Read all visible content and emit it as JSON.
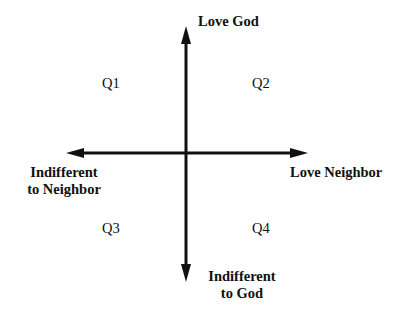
{
  "diagram": {
    "type": "quadrant",
    "axes": {
      "vertical": {
        "top_label": "Love God",
        "bottom_label_line1": "Indifferent",
        "bottom_label_line2": "to God"
      },
      "horizontal": {
        "left_label_line1": "Indifferent",
        "left_label_line2": "to Neighbor",
        "right_label": "Love Neighbor"
      }
    },
    "quadrants": [
      {
        "id": "Q1",
        "label": "Q1"
      },
      {
        "id": "Q2",
        "label": "Q2"
      },
      {
        "id": "Q3",
        "label": "Q3"
      },
      {
        "id": "Q4",
        "label": "Q4"
      }
    ],
    "colors": {
      "line": "#111111",
      "background": "#ffffff"
    }
  }
}
